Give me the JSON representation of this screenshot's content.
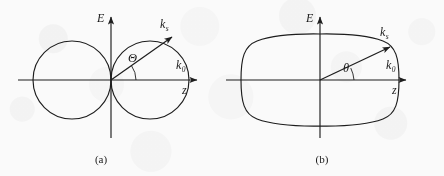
{
  "figure": {
    "panels": [
      {
        "id": "a",
        "caption": "(a)",
        "axis_vertical_label": "E",
        "axis_horizontal_label": "k",
        "axis_horizontal_sub": "0",
        "axis_horizontal_label2": "z",
        "ray_label": "k",
        "ray_label_sub": "s",
        "angle_label": "Θ",
        "pattern_type": "two-tangent-circles",
        "origin": {
          "x": 111,
          "y": 80
        },
        "lobe_radius": 39,
        "ray_angle_deg": 35
      },
      {
        "id": "b",
        "caption": "(b)",
        "axis_vertical_label": "E",
        "axis_horizontal_label": "k",
        "axis_horizontal_sub": "0",
        "axis_horizontal_label2": "z",
        "ray_label": "k",
        "ray_label_sub": "s",
        "angle_label": "θ",
        "pattern_type": "rounded-stadium-superellipse",
        "origin": {
          "x": 320,
          "y": 80
        },
        "half_width": 78,
        "half_height": 47,
        "ray_angle_deg": 25
      }
    ],
    "colors": {
      "ink": "#1d1d1d",
      "paper": "#fdfdfd"
    }
  }
}
